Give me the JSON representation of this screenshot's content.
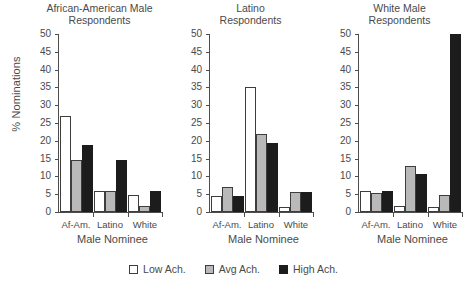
{
  "chart_data": {
    "type": "bar",
    "title": "",
    "xlabel": "Male Nominee",
    "ylabel": "% Nominations",
    "ylim": [
      0,
      50
    ],
    "ytick_step": 5,
    "yticks": [
      0,
      5,
      10,
      15,
      20,
      25,
      30,
      35,
      40,
      45,
      50
    ],
    "grid": false,
    "legend_position": "bottom",
    "categories": [
      "Af-Am.",
      "Latino",
      "White"
    ],
    "legend": [
      "Low Ach.",
      "Avg Ach.",
      "High Ach."
    ],
    "series_colors": {
      "low": "#ffffff",
      "avg": "#b9b9b9",
      "high": "#1c1c1c"
    },
    "panels": [
      {
        "title": "African-American Male\nRespondents",
        "categories": [
          "Af-Am.",
          "Latino",
          "White"
        ],
        "series": [
          {
            "name": "Low Ach.",
            "values": [
              27.0,
              6.0,
              4.7
            ]
          },
          {
            "name": "Avg Ach.",
            "values": [
              14.5,
              6.0,
              1.7
            ]
          },
          {
            "name": "High Ach.",
            "values": [
              18.8,
              14.7,
              6.0
            ]
          }
        ]
      },
      {
        "title": "Latino\nRespondents",
        "categories": [
          "Af-Am.",
          "Latino",
          "White"
        ],
        "series": [
          {
            "name": "Low Ach.",
            "values": [
              4.6,
              35.0,
              1.5
            ]
          },
          {
            "name": "Avg Ach.",
            "values": [
              7.0,
              22.0,
              5.5
            ]
          },
          {
            "name": "High Ach.",
            "values": [
              4.6,
              19.4,
              5.5
            ]
          }
        ]
      },
      {
        "title": "White Male\nRespondents",
        "categories": [
          "Af-Am.",
          "Latino",
          "White"
        ],
        "series": [
          {
            "name": "Low Ach.",
            "values": [
              5.8,
              1.6,
              1.4
            ]
          },
          {
            "name": "Avg Ach.",
            "values": [
              5.2,
              13.0,
              4.8
            ]
          },
          {
            "name": "High Ach.",
            "values": [
              6.0,
              10.8,
              50.0
            ]
          }
        ]
      }
    ]
  }
}
